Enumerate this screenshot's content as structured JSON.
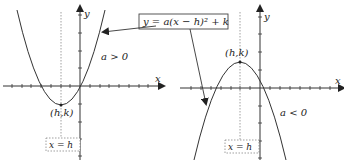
{
  "formula": "y = a(x − h)² + k",
  "left_graph": {
    "x_axis_label": "x",
    "y_axis_label": "y",
    "vertex_label": "(h,k)",
    "condition_label": "a > 0",
    "axis_of_symmetry_label": "x = h"
  },
  "right_graph": {
    "x_axis_label": "x",
    "y_axis_label": "y",
    "vertex_label": "(h,k)",
    "condition_label": "a < 0",
    "axis_of_symmetry_label": "x = h"
  },
  "colors": {
    "stroke": "#333333",
    "dotted": "#888888",
    "background": "#ffffff"
  }
}
